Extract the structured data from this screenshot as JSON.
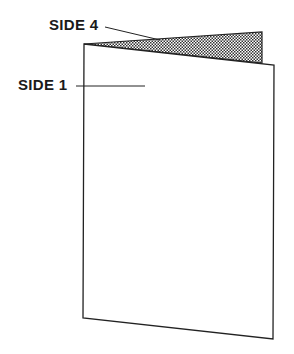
{
  "diagram": {
    "type": "folded-card",
    "labels": {
      "side4": "SIDE 4",
      "side1": "SIDE 1"
    },
    "colors": {
      "stroke": "#222222",
      "shade_dot": "#333333",
      "background": "#ffffff"
    },
    "geometry": {
      "front_page": [
        [
          84,
          44
        ],
        [
          274,
          65
        ],
        [
          273,
          339
        ],
        [
          83,
          318
        ]
      ],
      "back_flap": [
        [
          84,
          44
        ],
        [
          262,
          32
        ],
        [
          262,
          63
        ]
      ],
      "side4_leader": [
        [
          105,
          27
        ],
        [
          160,
          40
        ]
      ],
      "side1_leader": [
        [
          76,
          86
        ],
        [
          145,
          86
        ]
      ]
    }
  }
}
